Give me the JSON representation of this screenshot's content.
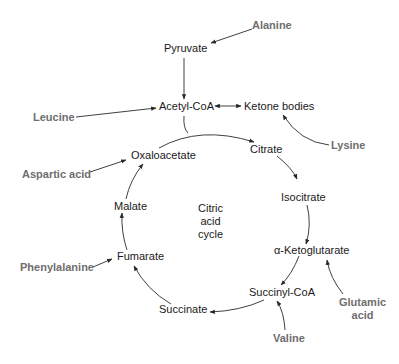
{
  "diagram": {
    "title": "Citric acid cycle",
    "center_label": [
      "Citric",
      "acid",
      "cycle"
    ],
    "metabolites": {
      "pyruvate": "Pyruvate",
      "acetyl_coa": "Acetyl-CoA",
      "ketone_bodies": "Ketone bodies",
      "oxaloacetate": "Oxaloacetate",
      "citrate": "Citrate",
      "isocitrate": "Isocitrate",
      "alpha_ketoglutarate": "α-Ketoglutarate",
      "succinyl_coa": "Succinyl-CoA",
      "succinate": "Succinate",
      "fumarate": "Fumarate",
      "malate": "Malate"
    },
    "amino_acids": {
      "alanine": "Alanine",
      "leucine": "Leucine",
      "lysine": "Lysine",
      "aspartic_acid": "Aspartic acid",
      "phenylalanine": "Phenylalanine",
      "glutamic_acid_line1": "Glutamic",
      "glutamic_acid_line2": "acid",
      "valine": "Valine"
    },
    "edges": [
      {
        "from": "Alanine",
        "to": "Pyruvate"
      },
      {
        "from": "Pyruvate",
        "to": "Acetyl-CoA"
      },
      {
        "from": "Leucine",
        "to": "Acetyl-CoA"
      },
      {
        "from": "Acetyl-CoA",
        "to": "Ketone bodies",
        "bidirectional": true
      },
      {
        "from": "Lysine",
        "to": "Ketone bodies"
      },
      {
        "from": "Acetyl-CoA",
        "to": "Citrate"
      },
      {
        "from": "Oxaloacetate",
        "to": "Citrate"
      },
      {
        "from": "Citrate",
        "to": "Isocitrate"
      },
      {
        "from": "Isocitrate",
        "to": "α-Ketoglutarate"
      },
      {
        "from": "Glutamic acid",
        "to": "α-Ketoglutarate"
      },
      {
        "from": "α-Ketoglutarate",
        "to": "Succinyl-CoA"
      },
      {
        "from": "Valine",
        "to": "Succinyl-CoA"
      },
      {
        "from": "Succinyl-CoA",
        "to": "Succinate"
      },
      {
        "from": "Succinate",
        "to": "Fumarate"
      },
      {
        "from": "Phenylalanine",
        "to": "Fumarate"
      },
      {
        "from": "Fumarate",
        "to": "Malate"
      },
      {
        "from": "Malate",
        "to": "Oxaloacetate"
      },
      {
        "from": "Aspartic acid",
        "to": "Oxaloacetate"
      }
    ],
    "colors": {
      "metabolite_text": "#1a1a1a",
      "amino_acid_text": "#6e6e6e",
      "arrow": "#2a2a2a",
      "background": "#ffffff"
    }
  }
}
